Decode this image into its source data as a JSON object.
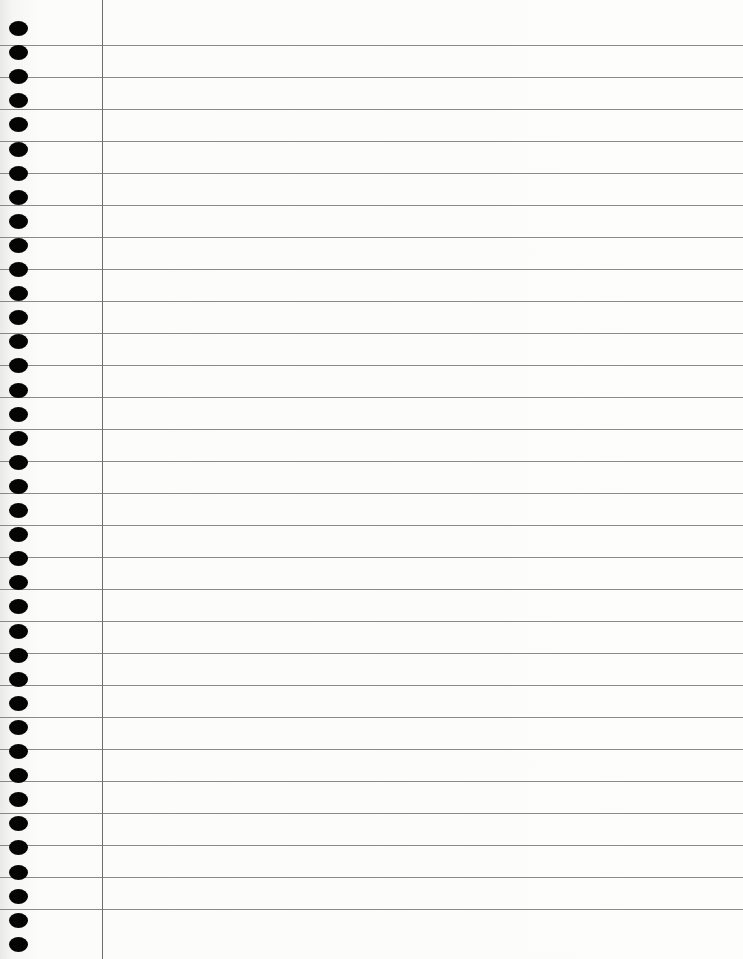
{
  "page": {
    "type": "lined notebook paper",
    "background_color": "#fbfbfa",
    "rule_color": "#8a8a8a",
    "margin_line_color": "#6e6e6e",
    "hole_color": "#050505",
    "margin_line_x": 102,
    "rule_first_y": 45,
    "rule_spacing": 32,
    "rule_count": 28,
    "hole_first_y": 28,
    "hole_spacing": 24.1,
    "hole_count": 39
  }
}
